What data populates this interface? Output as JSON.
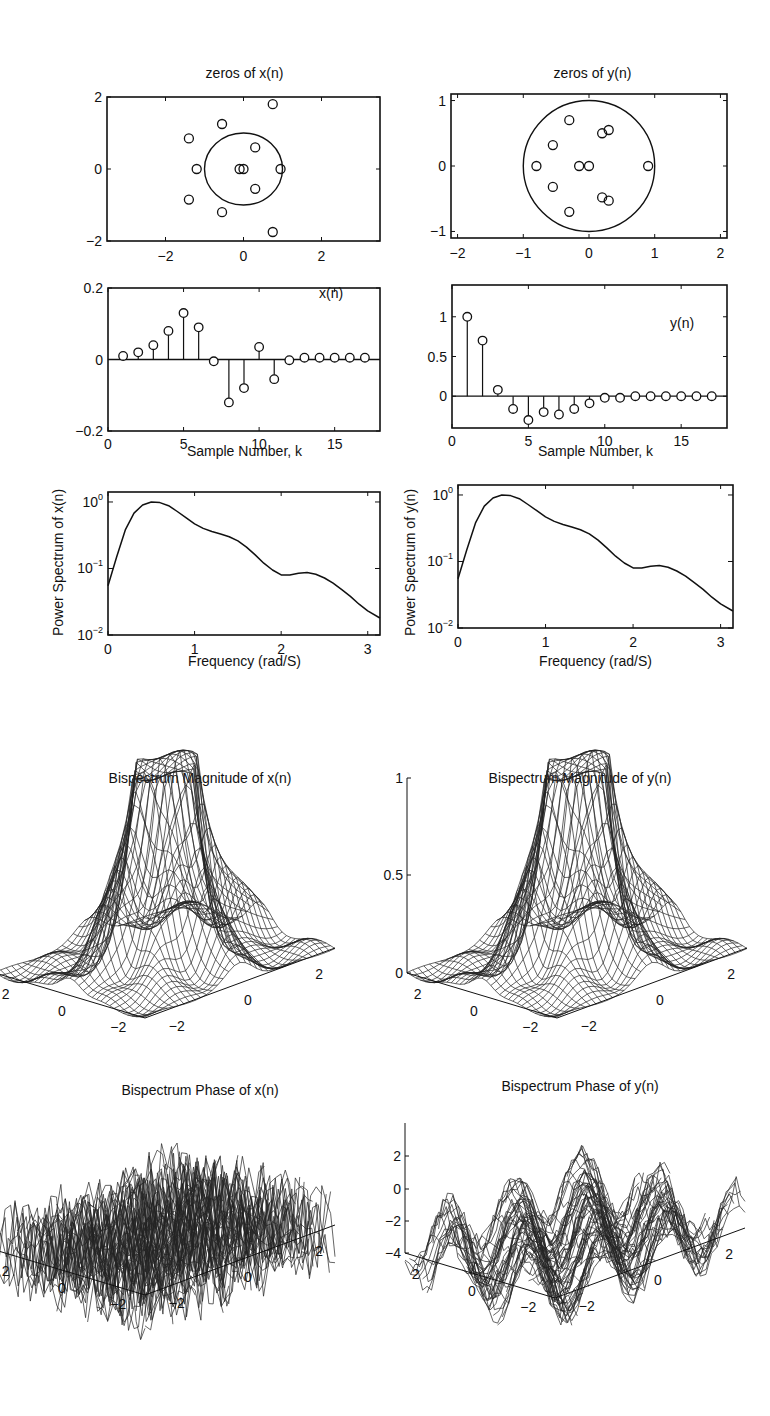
{
  "chart_data": [
    {
      "id": "zeros_x",
      "type": "scatter",
      "title": "zeros of x(n)",
      "xlabel": "",
      "ylabel": "",
      "xlim": [
        -3.5,
        3.5
      ],
      "ylim": [
        -2,
        2
      ],
      "xticks": [
        "-2",
        "0",
        "2"
      ],
      "yticks": [
        "2",
        "0",
        "-2"
      ],
      "unit_circle": true,
      "marker": "o",
      "points": [
        [
          0.75,
          1.8
        ],
        [
          -0.55,
          1.25
        ],
        [
          -1.4,
          0.85
        ],
        [
          0.3,
          0.6
        ],
        [
          -1.2,
          0.0
        ],
        [
          -0.1,
          0.0
        ],
        [
          0.0,
          0.0
        ],
        [
          0.95,
          0.0
        ],
        [
          0.3,
          -0.55
        ],
        [
          -1.4,
          -0.85
        ],
        [
          -0.55,
          -1.2
        ],
        [
          0.75,
          -1.75
        ]
      ]
    },
    {
      "id": "zeros_y",
      "type": "scatter",
      "title": "zeros of y(n)",
      "xlabel": "",
      "ylabel": "",
      "xlim": [
        -2.1,
        2.1
      ],
      "ylim": [
        -1.1,
        1.1
      ],
      "xticks": [
        "-2",
        "-1",
        "0",
        "1",
        "2"
      ],
      "yticks": [
        "1",
        "0",
        "-1"
      ],
      "unit_circle": true,
      "marker": "o",
      "points": [
        [
          -0.3,
          0.7
        ],
        [
          0.2,
          0.5
        ],
        [
          0.3,
          0.55
        ],
        [
          -0.55,
          0.32
        ],
        [
          -0.8,
          0.0
        ],
        [
          -0.15,
          0.0
        ],
        [
          0.0,
          0.0
        ],
        [
          0.9,
          0.0
        ],
        [
          -0.55,
          -0.32
        ],
        [
          0.2,
          -0.48
        ],
        [
          0.3,
          -0.53
        ],
        [
          -0.3,
          -0.7
        ]
      ]
    },
    {
      "id": "stem_x",
      "type": "stem",
      "title": "",
      "legend": "x(n)",
      "xlabel": "Sample Number, k",
      "ylabel": "",
      "xlim": [
        0,
        18
      ],
      "ylim": [
        -0.2,
        0.2
      ],
      "xticks": [
        "0",
        "5",
        "10",
        "15"
      ],
      "yticks": [
        "0.2",
        "0",
        "-0.2"
      ],
      "x": [
        1,
        2,
        3,
        4,
        5,
        6,
        7,
        8,
        9,
        10,
        11,
        12,
        13,
        14,
        15,
        16,
        17
      ],
      "values": [
        0.01,
        0.02,
        0.04,
        0.08,
        0.13,
        0.09,
        -0.005,
        -0.12,
        -0.08,
        0.035,
        -0.055,
        -0.002,
        0.005,
        0.005,
        0.005,
        0.005,
        0.005
      ]
    },
    {
      "id": "stem_y",
      "type": "stem",
      "title": "",
      "legend": "y(n)",
      "xlabel": "Sample Number, k",
      "ylabel": "",
      "xlim": [
        0,
        18
      ],
      "ylim": [
        -0.4,
        1.4
      ],
      "xticks": [
        "0",
        "5",
        "10",
        "15"
      ],
      "yticks": [
        "1",
        "0.5",
        "0"
      ],
      "x": [
        1,
        2,
        3,
        4,
        5,
        6,
        7,
        8,
        9,
        10,
        11,
        12,
        13,
        14,
        15,
        16,
        17
      ],
      "values": [
        1.0,
        0.7,
        0.08,
        -0.16,
        -0.3,
        -0.2,
        -0.23,
        -0.16,
        -0.09,
        -0.02,
        -0.02,
        0.0,
        0.0,
        0.0,
        0.0,
        0.0,
        0.0
      ]
    },
    {
      "id": "psd_x",
      "type": "line",
      "title": "",
      "xlabel": "Frequency (rad/S)",
      "ylabel": "Power Spectrum of x(n)",
      "xlim": [
        0,
        3.14159
      ],
      "ylim": [
        0.01,
        1
      ],
      "yscale": "log",
      "xticks": [
        "0",
        "1",
        "2",
        "3"
      ],
      "yticks": [
        "10^0",
        "10^-1",
        "10^-2"
      ],
      "x": [
        0,
        0.1,
        0.2,
        0.3,
        0.4,
        0.5,
        0.6,
        0.7,
        0.8,
        0.9,
        1.0,
        1.1,
        1.2,
        1.3,
        1.4,
        1.5,
        1.6,
        1.7,
        1.8,
        1.9,
        2.0,
        2.1,
        2.2,
        2.3,
        2.4,
        2.5,
        2.6,
        2.7,
        2.8,
        2.9,
        3.0,
        3.14
      ],
      "values": [
        0.055,
        0.15,
        0.38,
        0.68,
        0.9,
        1.0,
        0.98,
        0.88,
        0.72,
        0.58,
        0.47,
        0.4,
        0.36,
        0.33,
        0.3,
        0.26,
        0.21,
        0.16,
        0.12,
        0.095,
        0.08,
        0.08,
        0.085,
        0.087,
        0.082,
        0.072,
        0.06,
        0.048,
        0.038,
        0.029,
        0.023,
        0.018
      ]
    },
    {
      "id": "psd_y",
      "type": "line",
      "title": "",
      "xlabel": "Frequency (rad/S)",
      "ylabel": "Power Spectrum of y(n)",
      "xlim": [
        0,
        3.14159
      ],
      "ylim": [
        0.01,
        1
      ],
      "yscale": "log",
      "xticks": [
        "0",
        "1",
        "2",
        "3"
      ],
      "yticks": [
        "10^0",
        "10^-1",
        "10^-2"
      ],
      "x": [
        0,
        0.1,
        0.2,
        0.3,
        0.4,
        0.5,
        0.6,
        0.7,
        0.8,
        0.9,
        1.0,
        1.1,
        1.2,
        1.3,
        1.4,
        1.5,
        1.6,
        1.7,
        1.8,
        1.9,
        2.0,
        2.1,
        2.2,
        2.3,
        2.4,
        2.5,
        2.6,
        2.7,
        2.8,
        2.9,
        3.0,
        3.14
      ],
      "values": [
        0.055,
        0.15,
        0.38,
        0.68,
        0.9,
        1.0,
        0.98,
        0.88,
        0.72,
        0.58,
        0.47,
        0.4,
        0.36,
        0.33,
        0.3,
        0.26,
        0.21,
        0.16,
        0.12,
        0.095,
        0.08,
        0.08,
        0.085,
        0.087,
        0.082,
        0.072,
        0.06,
        0.048,
        0.038,
        0.029,
        0.023,
        0.018
      ]
    },
    {
      "id": "bispec_mag_x",
      "type": "surface",
      "title": "Bispectrum Magnitude of x(n)",
      "zlim": [
        0,
        1
      ],
      "zticks": [
        "1",
        "0.5",
        "0"
      ],
      "xticks": [
        "-2",
        "0",
        "2"
      ],
      "yticks": [
        "2",
        "0",
        "-2"
      ],
      "description": "mesh surface with sharp central ridges peaking near 1, flat near 0 elsewhere"
    },
    {
      "id": "bispec_mag_y",
      "type": "surface",
      "title": "Bispectrum Magnitude of y(n)",
      "zlim": [
        0,
        1
      ],
      "zticks": [
        "1",
        "0.5",
        "0"
      ],
      "xticks": [
        "-2",
        "0",
        "2"
      ],
      "yticks": [
        "2",
        "0",
        "-2"
      ],
      "description": "mesh surface with sharp central ridges peaking near 1, flat near 0 elsewhere"
    },
    {
      "id": "bispec_phase_x",
      "type": "surface",
      "title": "Bispectrum Phase of x(n)",
      "zlim": [
        -4,
        4
      ],
      "zticks": [
        "2",
        "0",
        "-2",
        "-4"
      ],
      "xticks": [
        "-2",
        "0",
        "2"
      ],
      "yticks": [
        "2",
        "0",
        "-2"
      ],
      "description": "highly irregular phase surface between -pi and pi"
    },
    {
      "id": "bispec_phase_y",
      "type": "surface",
      "title": "Bispectrum Phase of y(n)",
      "zlim": [
        -4,
        4
      ],
      "zticks": [
        "2",
        "0",
        "-2",
        "-4"
      ],
      "xticks": [
        "-2",
        "0",
        "2"
      ],
      "yticks": [
        "2",
        "0",
        "-2"
      ],
      "description": "irregular phase surface between -pi and pi, smoother patches"
    }
  ],
  "labels": {
    "zeros_x_title": "zeros of x(n)",
    "zeros_y_title": "zeros of y(n)",
    "stem_x_legend": "x(n)",
    "stem_y_legend": "y(n)",
    "sample_xlabel": "Sample Number, k",
    "freq_xlabel": "Frequency (rad/S)",
    "psd_x_ylabel": "Power Spectrum of x(n)",
    "psd_y_ylabel": "Power Spectrum of y(n)",
    "mag_x_title": "Bispectrum Magnitude of x(n)",
    "mag_y_title": "Bispectrum Magnitude of y(n)",
    "phase_x_title": "Bispectrum Phase of x(n)",
    "phase_y_title": "Bispectrum Phase of y(n)"
  }
}
